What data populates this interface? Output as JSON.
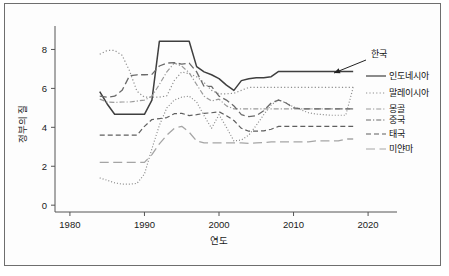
{
  "figure": {
    "border_color": "#6e6e6e",
    "background": "#ffffff"
  },
  "chart_data": {
    "type": "line",
    "title": "",
    "xlabel": "연도",
    "ylabel": "정부의 질",
    "xlim": [
      1978,
      2022
    ],
    "ylim": [
      -0.35,
      9.0
    ],
    "xticks": [
      1980,
      1990,
      2000,
      2010,
      2020
    ],
    "yticks": [
      0,
      2,
      4,
      6,
      8
    ],
    "xtick_labels": [
      "1980",
      "1990",
      "2000",
      "2010",
      "2020"
    ],
    "ytick_labels": [
      "0",
      "2",
      "4",
      "6",
      "8"
    ],
    "grid": false,
    "legend_position": "right-outside",
    "annotations": [
      {
        "text": "한국",
        "target_series": "한국",
        "arrow": true,
        "label_x": 371,
        "label_y": 57,
        "arrow_from_x": 366,
        "arrow_from_y": 60,
        "arrow_to_x": 334,
        "arrow_to_y": 73
      }
    ],
    "x": [
      1984,
      1985,
      1986,
      1987,
      1988,
      1989,
      1990,
      1991,
      1992,
      1993,
      1994,
      1995,
      1996,
      1997,
      1998,
      1999,
      2000,
      2001,
      2002,
      2003,
      2004,
      2005,
      2006,
      2007,
      2008,
      2009,
      2010,
      2011,
      2012,
      2013,
      2014,
      2015,
      2016,
      2017,
      2018
    ],
    "series": [
      {
        "name": "한국",
        "style": "solid",
        "color": "#3f3f3f",
        "width": 1.5,
        "values": [
          5.83,
          5.2,
          4.67,
          4.67,
          4.67,
          4.67,
          4.67,
          5.4,
          8.42,
          8.42,
          8.42,
          8.42,
          8.42,
          7.12,
          6.85,
          6.7,
          6.5,
          6.17,
          5.9,
          6.4,
          6.5,
          6.55,
          6.55,
          6.6,
          6.87,
          6.87,
          6.87,
          6.87,
          6.87,
          6.87,
          6.87,
          6.87,
          6.87,
          6.87,
          6.87
        ]
      },
      {
        "name": "인도네시아",
        "style": "dotted-fine",
        "color": "#8a8a8a",
        "width": 1.2,
        "values": [
          1.4,
          1.28,
          1.15,
          1.08,
          1.08,
          1.12,
          1.6,
          2.9,
          4.1,
          5.0,
          5.4,
          5.55,
          5.6,
          5.3,
          4.6,
          3.95,
          4.65,
          4.0,
          3.3,
          3.35,
          3.6,
          4.1,
          4.65,
          5.15,
          5.42,
          5.25,
          5.05,
          4.9,
          4.75,
          4.68,
          4.65,
          4.62,
          4.62,
          4.62,
          6.05
        ]
      },
      {
        "name": "말레이시아",
        "style": "dotted",
        "color": "#8f8f8f",
        "width": 1.2,
        "values": [
          7.75,
          7.95,
          7.95,
          7.7,
          6.9,
          5.85,
          5.55,
          5.55,
          5.55,
          5.62,
          6.4,
          6.85,
          6.75,
          6.6,
          6.3,
          5.9,
          5.72,
          5.72,
          5.75,
          5.9,
          6.05,
          6.05,
          6.05,
          6.05,
          6.05,
          6.05,
          6.05,
          6.05,
          6.05,
          6.05,
          6.05,
          6.05,
          6.05,
          6.05,
          6.05
        ]
      },
      {
        "name": "몽골",
        "style": "dashdot",
        "color": "#9a9a9a",
        "width": 1.2,
        "values": [
          5.45,
          5.3,
          5.28,
          5.3,
          5.3,
          5.35,
          5.4,
          5.6,
          6.2,
          6.85,
          7.3,
          7.15,
          6.8,
          6.2,
          5.6,
          5.35,
          5.45,
          5.1,
          4.95,
          4.95,
          4.95,
          4.95,
          4.95,
          4.95,
          4.95,
          4.95,
          4.95,
          4.95,
          4.95,
          4.95,
          4.95,
          4.95,
          4.95,
          4.95,
          4.95
        ]
      },
      {
        "name": "중국",
        "style": "dashed-long",
        "color": "#6a6a6a",
        "width": 1.3,
        "values": [
          5.6,
          5.55,
          5.6,
          5.9,
          6.65,
          6.7,
          6.7,
          6.72,
          7.15,
          7.3,
          7.32,
          7.25,
          7.3,
          6.85,
          6.1,
          6.1,
          5.6,
          5.4,
          5.1,
          4.65,
          4.55,
          4.6,
          4.85,
          5.25,
          5.4,
          5.25,
          5.0,
          4.95,
          4.95,
          4.95,
          4.95,
          4.95,
          4.95,
          4.95,
          4.95
        ]
      },
      {
        "name": "태국",
        "style": "dashed",
        "color": "#5f5f5f",
        "width": 1.2,
        "values": [
          3.6,
          3.6,
          3.6,
          3.6,
          3.6,
          3.6,
          4.05,
          4.4,
          4.45,
          4.5,
          4.7,
          4.72,
          4.6,
          4.65,
          4.72,
          4.75,
          4.8,
          4.6,
          4.35,
          3.95,
          3.8,
          3.8,
          3.82,
          3.9,
          4.05,
          4.05,
          4.05,
          4.05,
          4.05,
          4.05,
          4.05,
          4.05,
          4.05,
          4.05,
          4.05
        ]
      },
      {
        "name": "미얀마",
        "style": "dashed-vlong",
        "color": "#a5a5a5",
        "width": 1.3,
        "values": [
          2.2,
          2.2,
          2.2,
          2.2,
          2.2,
          2.2,
          2.2,
          2.6,
          3.15,
          3.6,
          3.95,
          4.05,
          3.75,
          3.3,
          3.2,
          3.2,
          3.2,
          3.2,
          3.2,
          3.2,
          3.18,
          3.2,
          3.22,
          3.25,
          3.25,
          3.25,
          3.25,
          3.25,
          3.25,
          3.3,
          3.3,
          3.3,
          3.3,
          3.4,
          3.4
        ]
      }
    ],
    "legend": [
      {
        "label": "인도네시아",
        "style": "solid",
        "color": "#3f3f3f",
        "y": 76
      },
      {
        "label": "말레이시아",
        "style": "dotted",
        "color": "#8f8f8f",
        "y": 93
      },
      {
        "label": "몽골",
        "style": "dashdot",
        "color": "#9a9a9a",
        "y": 109
      },
      {
        "label": "중국",
        "style": "dashdot2",
        "color": "#6a6a6a",
        "y": 120
      },
      {
        "label": "태국",
        "style": "dashed",
        "color": "#5f5f5f",
        "y": 134
      },
      {
        "label": "미얀마",
        "style": "dashed-vlong",
        "color": "#a5a5a5",
        "y": 149
      }
    ]
  }
}
